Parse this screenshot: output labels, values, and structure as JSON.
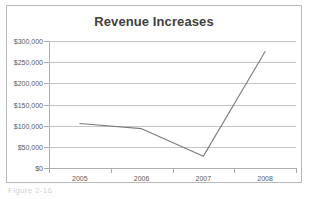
{
  "chart_data": {
    "type": "line",
    "title": "Revenue Increases",
    "xlabel": "",
    "ylabel": "",
    "categories": [
      "2005",
      "2006",
      "2007",
      "2008"
    ],
    "values": [
      105000,
      93000,
      28000,
      275000
    ],
    "series": [
      {
        "name": "Revenue",
        "values": [
          105000,
          93000,
          28000,
          275000
        ],
        "color": "#7b7b7b"
      }
    ],
    "ylim": [
      0,
      300000
    ],
    "ytick_values": [
      0,
      50000,
      100000,
      150000,
      200000,
      250000,
      300000
    ],
    "ytick_labels": [
      "$0",
      "$50,000",
      "$100,000",
      "$150,000",
      "$200,000",
      "$250,000",
      "$300,000"
    ],
    "xtick_labels": [
      "2005",
      "2006",
      "2007",
      "2008"
    ],
    "grid": true,
    "grid_axis": "y",
    "legend": false,
    "legend_position": "none",
    "markers": false,
    "border": true
  },
  "colors": {
    "line": "#7b7b7b",
    "gridline": "#c6c6c6",
    "axis": "#b0b0b0",
    "frame_border": "#b9b9b9",
    "title_text": "#3f3f3f",
    "tick_text": "#595959",
    "plot_background": "#ffffff"
  },
  "caption": {
    "text": "Figure 2-16"
  }
}
